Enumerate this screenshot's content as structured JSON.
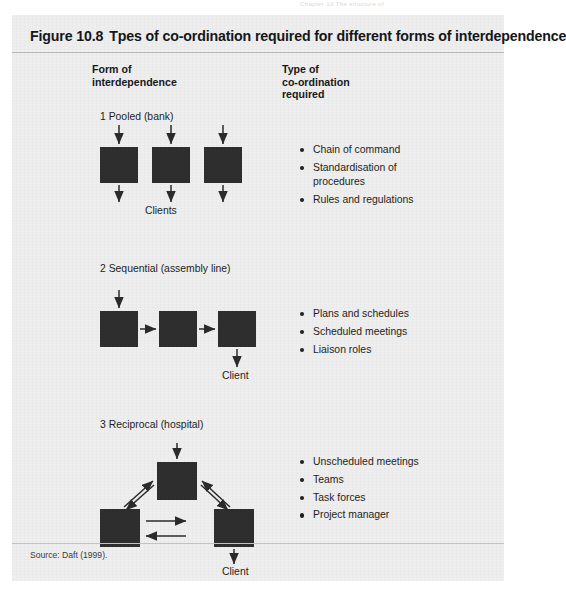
{
  "page": {
    "running_head": "Chapter 10 The structure of"
  },
  "figure": {
    "number": "Figure 10.8",
    "title": "Tpes of co-ordination required for different forms of interdependence",
    "source": "Source: Daft (1999).",
    "columns": {
      "left_heading": "Form of\ninterdependence",
      "right_heading": "Type of\nco-ordination\nrequired"
    },
    "sections": [
      {
        "label": "1 Pooled (bank)",
        "output_caption": "Clients",
        "bullets": [
          "Chain of command",
          "Standardisation of\nprocedures",
          "Rules and regulations"
        ]
      },
      {
        "label": "2 Sequential (assembly line)",
        "output_caption": "Client",
        "bullets": [
          "Plans and schedules",
          "Scheduled meetings",
          "Liaison roles"
        ]
      },
      {
        "label": "3 Reciprocal (hospital)",
        "output_caption": "Client",
        "bullets": [
          "Unscheduled meetings",
          "Teams",
          "Task forces",
          "Project manager"
        ]
      }
    ]
  },
  "colors": {
    "panel_background": "#eeeeee",
    "node_fill": "#2e2e2e",
    "text": "#1d1e22",
    "rule": "#b9b9b9"
  }
}
